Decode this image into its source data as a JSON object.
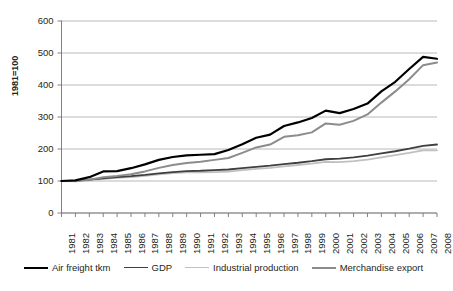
{
  "chart_data": {
    "type": "line",
    "title": "",
    "xlabel": "",
    "ylabel": "1981=100",
    "ylim": [
      0,
      600
    ],
    "yticks": [
      0,
      100,
      200,
      300,
      400,
      500,
      600
    ],
    "grid": true,
    "legend_position": "bottom",
    "categories": [
      "1981",
      "1982",
      "1983",
      "1984",
      "1985",
      "1986",
      "1987",
      "1988",
      "1989",
      "1990",
      "1991",
      "1992",
      "1993",
      "1994",
      "1995",
      "1996",
      "1997",
      "1998",
      "1999",
      "2000",
      "2001",
      "2002",
      "2003",
      "2004",
      "2005",
      "2006",
      "2007",
      "2008"
    ],
    "series": [
      {
        "name": "Air freight tkm",
        "color": "#000000",
        "width": 2.2,
        "values": [
          100,
          102,
          112,
          130,
          131,
          140,
          152,
          166,
          175,
          180,
          182,
          184,
          197,
          215,
          235,
          245,
          272,
          283,
          297,
          320,
          312,
          325,
          342,
          380,
          410,
          450,
          488,
          482
        ]
      },
      {
        "name": "GDP",
        "color": "#3f3f3f",
        "width": 1.8,
        "values": [
          100,
          101,
          104,
          108,
          112,
          115,
          119,
          124,
          128,
          131,
          132,
          134,
          136,
          140,
          144,
          148,
          153,
          157,
          162,
          168,
          170,
          174,
          179,
          186,
          193,
          201,
          210,
          214
        ]
      },
      {
        "name": "Industrial production",
        "color": "#c0c0c0",
        "width": 1.8,
        "values": [
          100,
          99,
          102,
          107,
          110,
          112,
          116,
          121,
          125,
          127,
          127,
          128,
          129,
          134,
          138,
          141,
          146,
          150,
          154,
          160,
          159,
          162,
          167,
          174,
          181,
          188,
          196,
          196
        ]
      },
      {
        "name": "Merchandise export",
        "color": "#8c8c8c",
        "width": 2.0,
        "values": [
          100,
          100,
          104,
          112,
          116,
          121,
          130,
          141,
          150,
          156,
          160,
          166,
          172,
          188,
          205,
          214,
          238,
          243,
          252,
          280,
          276,
          288,
          308,
          345,
          380,
          418,
          462,
          470
        ]
      }
    ]
  },
  "legend": {
    "items": [
      {
        "label": "Air freight tkm"
      },
      {
        "label": "GDP"
      },
      {
        "label": "Industrial production"
      },
      {
        "label": "Merchandise export"
      }
    ]
  }
}
